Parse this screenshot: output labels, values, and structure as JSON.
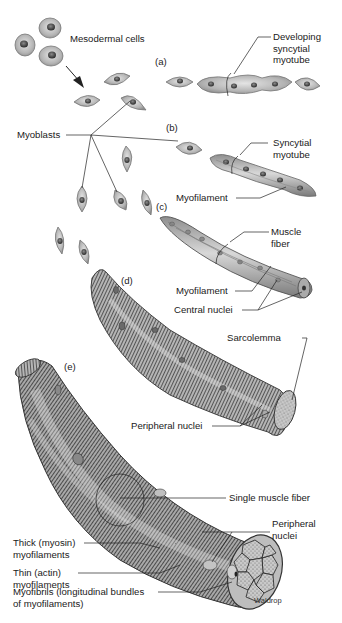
{
  "figure": {
    "type": "diagram",
    "credit": "Waldrop"
  },
  "stages": [
    {
      "id": "a",
      "label": "(a)"
    },
    {
      "id": "b",
      "label": "(b)"
    },
    {
      "id": "c",
      "label": "(c)"
    },
    {
      "id": "d",
      "label": "(d)"
    },
    {
      "id": "e",
      "label": "(e)"
    }
  ],
  "labels": {
    "mesodermal_cells": "Mesodermal cells",
    "myoblasts": "Myoblasts",
    "developing_syncytial_myotube": [
      "Developing",
      "syncytial",
      "myotube"
    ],
    "syncytial_myotube": [
      "Syncytial",
      "myotube"
    ],
    "myofilament_b": "Myofilament",
    "muscle_fiber": [
      "Muscle",
      "fiber"
    ],
    "myofilament_c": "Myofilament",
    "central_nuclei": "Central nuclei",
    "sarcolemma": "Sarcolemma",
    "peripheral_nuclei_d": "Peripheral nuclei",
    "single_muscle_fiber": "Single muscle fiber",
    "peripheral_nuclei_e": [
      "Peripheral",
      "nuclei"
    ],
    "thick_myofilaments": [
      "Thick (myosin)",
      "myofilaments"
    ],
    "thin_myofilaments": [
      "Thin (actin)",
      "myofilaments"
    ],
    "myofibrils": [
      "Myofibrils (longitudinal bundles",
      "of myofilaments)"
    ],
    "credit": "Waldrop"
  },
  "colors": {
    "cell_fill": "#b9b9b9",
    "cell_edge": "#6a6a6a",
    "nucleus": "#3a3a3a",
    "fiber_light": "#d0d0d0",
    "fiber_dark": "#5a5a5a",
    "leader_line": "#222222",
    "text": "#1a1a1a"
  }
}
